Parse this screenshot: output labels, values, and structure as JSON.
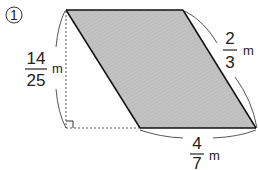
{
  "problem": {
    "number": "1",
    "shape": "parallelogram",
    "fill_color": "#bdbdbd",
    "edge_color": "#111111",
    "height_label": {
      "numerator": "14",
      "denominator": "25",
      "unit": "m"
    },
    "side_label": {
      "numerator": "2",
      "denominator": "3",
      "unit": "m"
    },
    "base_label": {
      "numerator": "4",
      "denominator": "7",
      "unit": "m"
    }
  }
}
